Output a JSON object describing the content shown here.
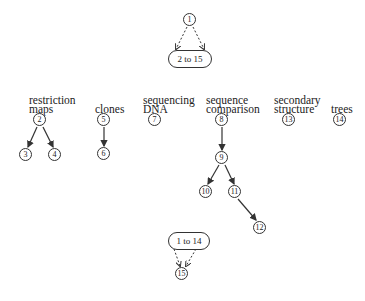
{
  "diagram": {
    "top": {
      "root_node": "1",
      "group_label": "2 to 15",
      "edge_style": "dashed"
    },
    "categories": [
      {
        "label_line1": "restriction",
        "label_line2": "maps",
        "root": "2",
        "children": [
          "3",
          "4"
        ]
      },
      {
        "label_line1": "clones",
        "label_line2": "",
        "root": "5",
        "children": [
          "6"
        ]
      },
      {
        "label_line1": "sequencing",
        "label_line2": "DNA",
        "root": "7",
        "children": []
      },
      {
        "label_line1": "sequence",
        "label_line2": "comparison",
        "root": "8",
        "children": [
          "9"
        ],
        "grandchildren": {
          "9": [
            "10",
            "11"
          ],
          "11": [
            "12"
          ]
        }
      },
      {
        "label_line1": "secondary",
        "label_line2": "structure",
        "root": "13",
        "children": []
      },
      {
        "label_line1": "trees",
        "label_line2": "",
        "root": "14",
        "children": []
      }
    ],
    "nodes": {
      "n1": "1",
      "n2": "2",
      "n3": "3",
      "n4": "4",
      "n5": "5",
      "n6": "6",
      "n7": "7",
      "n8": "8",
      "n9": "9",
      "n10": "10",
      "n11": "11",
      "n12": "12",
      "n13": "13",
      "n14": "14",
      "n15": "15"
    },
    "bottom": {
      "group_label": "1 to 14",
      "target_node": "15",
      "edge_style": "dashed"
    },
    "edges": [
      {
        "from": "1",
        "to": "2 to 15",
        "style": "dashed"
      },
      {
        "from": "2",
        "to": "3",
        "style": "solid"
      },
      {
        "from": "2",
        "to": "4",
        "style": "solid"
      },
      {
        "from": "5",
        "to": "6",
        "style": "solid"
      },
      {
        "from": "8",
        "to": "9",
        "style": "solid"
      },
      {
        "from": "9",
        "to": "10",
        "style": "solid"
      },
      {
        "from": "9",
        "to": "11",
        "style": "solid"
      },
      {
        "from": "11",
        "to": "12",
        "style": "solid"
      },
      {
        "from": "1 to 14",
        "to": "15",
        "style": "dashed"
      }
    ]
  }
}
